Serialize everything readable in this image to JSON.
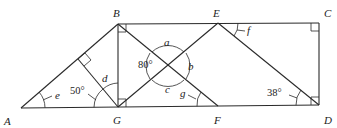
{
  "points": {
    "A": {
      "label": "A",
      "x": 21,
      "y": 108,
      "lx": 4,
      "ly": 125
    },
    "B": {
      "label": "B",
      "x": 118,
      "y": 24,
      "lx": 113,
      "ly": 17
    },
    "C": {
      "label": "C",
      "x": 319,
      "y": 23,
      "lx": 325,
      "ly": 17
    },
    "D": {
      "label": "D",
      "x": 319,
      "y": 105,
      "lx": 325,
      "ly": 124
    },
    "E": {
      "label": "E",
      "x": 218,
      "y": 23,
      "lx": 213,
      "ly": 17
    },
    "F": {
      "label": "F",
      "x": 218,
      "y": 106,
      "lx": 214,
      "ly": 124
    },
    "G": {
      "label": "G",
      "x": 118,
      "y": 107,
      "lx": 113,
      "ly": 124
    }
  },
  "angle_labels": {
    "a": "a",
    "b": "b",
    "c": "c",
    "d": "d",
    "e": "e",
    "f": "f",
    "g": "g"
  },
  "angle_values": {
    "angle_50": "50°",
    "angle_80": "80°",
    "angle_38": "38°"
  }
}
